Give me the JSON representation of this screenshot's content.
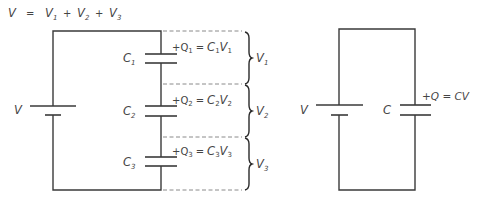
{
  "title_equation": {
    "lhs": "V",
    "eq": "=",
    "terms": [
      {
        "symbol": "V",
        "sub": "1"
      },
      {
        "symbol": "V",
        "sub": "2"
      },
      {
        "symbol": "V",
        "sub": "3"
      }
    ],
    "plus": "+"
  },
  "series_circuit": {
    "battery_label": "V",
    "capacitors": [
      {
        "label": "C",
        "sub": "1",
        "charge": "+Q",
        "charge_sub": "1",
        "equals": "=",
        "cap": "C",
        "cap_sub": "1",
        "volt": "V",
        "volt_sub": "1",
        "brace_label": "V",
        "brace_sub": "1"
      },
      {
        "label": "C",
        "sub": "2",
        "charge": "+Q",
        "charge_sub": "2",
        "equals": "=",
        "cap": "C",
        "cap_sub": "2",
        "volt": "V",
        "volt_sub": "2",
        "brace_label": "V",
        "brace_sub": "2"
      },
      {
        "label": "C",
        "sub": "3",
        "charge": "+Q",
        "charge_sub": "3",
        "equals": "=",
        "cap": "C",
        "cap_sub": "3",
        "volt": "V",
        "volt_sub": "3",
        "brace_label": "V",
        "brace_sub": "3"
      }
    ]
  },
  "equivalent_circuit": {
    "battery_label": "V",
    "capacitor_label": "C",
    "charge_equation": "+Q = CV"
  },
  "colors": {
    "wire": "#3a3a3a",
    "dashed": "#8a8a8a",
    "text": "#444444",
    "background": "#ffffff"
  }
}
